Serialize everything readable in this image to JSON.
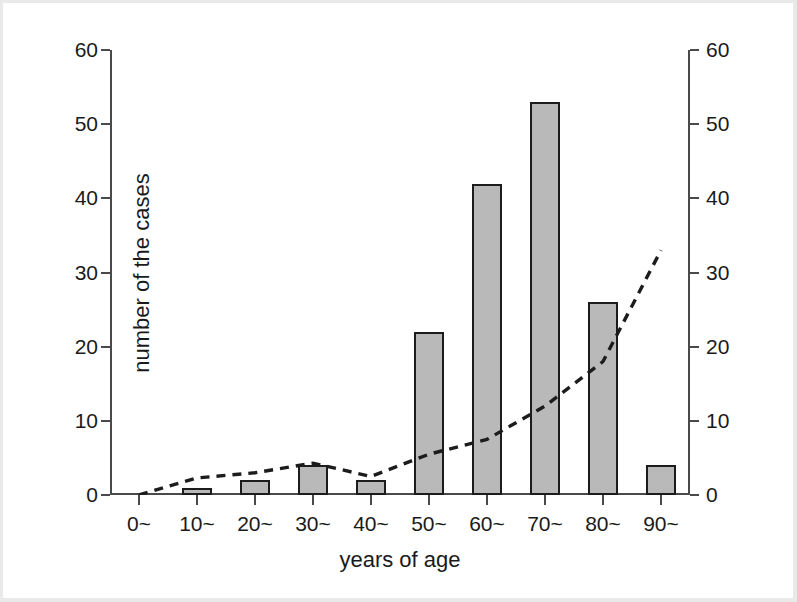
{
  "chart_data": {
    "type": "bar",
    "title": "",
    "subtitle": "",
    "xlabel": "years of age",
    "ylabel": "number of the cases",
    "y2label": "% of the cases",
    "categories": [
      "0~",
      "10~",
      "20~",
      "30~",
      "40~",
      "50~",
      "60~",
      "70~",
      "80~",
      "90~"
    ],
    "ylim": [
      0,
      60
    ],
    "y2lim": [
      0,
      60
    ],
    "yticks": [
      0,
      10,
      20,
      30,
      40,
      50,
      60
    ],
    "y2ticks": [
      0,
      10,
      20,
      30,
      40,
      50,
      60
    ],
    "ytick_labels": [
      "0",
      "10",
      "20",
      "30",
      "40",
      "50",
      "60"
    ],
    "y2tick_labels": [
      "0",
      "10",
      "20",
      "30",
      "40",
      "50",
      "60"
    ],
    "grid": false,
    "legend": "none",
    "series": [
      {
        "name": "number of the cases",
        "type": "bar",
        "axis": "left",
        "fill_color": "#b9b9b9",
        "edge_color": "#1c1c1c",
        "values": [
          0,
          1,
          2,
          4,
          2,
          22,
          42,
          53,
          26,
          4
        ]
      },
      {
        "name": "% of the cases",
        "type": "line",
        "axis": "right",
        "line_style": "dashed",
        "color": "#1c1c1c",
        "values": [
          0,
          2.3,
          3.0,
          4.3,
          2.5,
          5.5,
          7.5,
          12.0,
          18.0,
          33.0
        ]
      }
    ]
  },
  "axes": {
    "left_title": "number of the cases",
    "right_title": "% of the cases",
    "bottom_title": "years of age"
  }
}
